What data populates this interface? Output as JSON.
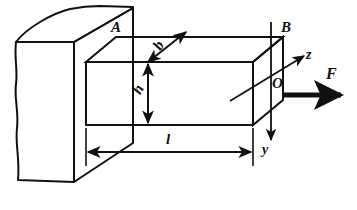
{
  "figure": {
    "type": "engineering-diagram",
    "width": 357,
    "height": 210,
    "background_color": "#ffffff",
    "line_color": "#111111"
  },
  "labels": {
    "point_a": "A",
    "point_b": "B",
    "origin": "O",
    "force": "F",
    "axis_z": "z",
    "axis_y": "y",
    "length": "l",
    "height": "h",
    "width": "b"
  },
  "elements": {
    "wall": "support-wall-block",
    "beam": "rectangular-cantilever-beam",
    "dimension_length": "l",
    "dimension_height": "h",
    "dimension_width": "b",
    "load_arrow": "F",
    "axis_arrow_z": "z",
    "axis_arrow_y": "y"
  }
}
